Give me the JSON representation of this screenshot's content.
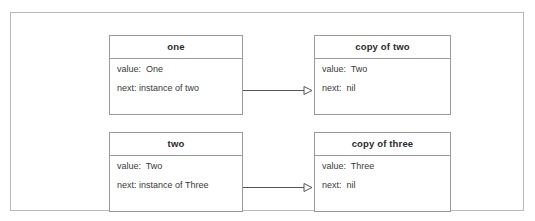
{
  "diagram": {
    "style": {
      "frame_border_color": "#b9b9b9",
      "box_border_color": "#9a9a9a",
      "background_color": "#ffffff",
      "header_text_color": "#2b2b2b",
      "body_text_color": "#3a3a3a",
      "connector_color": "#555555"
    },
    "boxes": [
      {
        "id": "one",
        "header": "one",
        "attributes": [
          {
            "label": "value:",
            "value": "One",
            "text": "value:  One"
          },
          {
            "label": "next:",
            "value": "instance of two",
            "text": "next: instance of two"
          }
        ]
      },
      {
        "id": "copy-of-two",
        "header": "copy of two",
        "attributes": [
          {
            "label": "value:",
            "value": "Two",
            "text": "value:  Two"
          },
          {
            "label": "next:",
            "value": "nil",
            "text": "next:  nil"
          }
        ]
      },
      {
        "id": "two",
        "header": "two",
        "attributes": [
          {
            "label": "value:",
            "value": "Two",
            "text": "value:  Two"
          },
          {
            "label": "next:",
            "value": "instance of Three",
            "text": "next: instance of Three"
          }
        ]
      },
      {
        "id": "copy-of-three",
        "header": "copy of three",
        "attributes": [
          {
            "label": "value:",
            "value": "Three",
            "text": "value:  Three"
          },
          {
            "label": "next:",
            "value": "nil",
            "text": "next:  nil"
          }
        ]
      }
    ],
    "connectors": [
      {
        "id": "one-to-copy-of-two",
        "from": "one",
        "to": "copy-of-two",
        "arrowhead": "open-triangle"
      },
      {
        "id": "two-to-copy-of-three",
        "from": "two",
        "to": "copy-of-three",
        "arrowhead": "open-triangle"
      }
    ]
  }
}
